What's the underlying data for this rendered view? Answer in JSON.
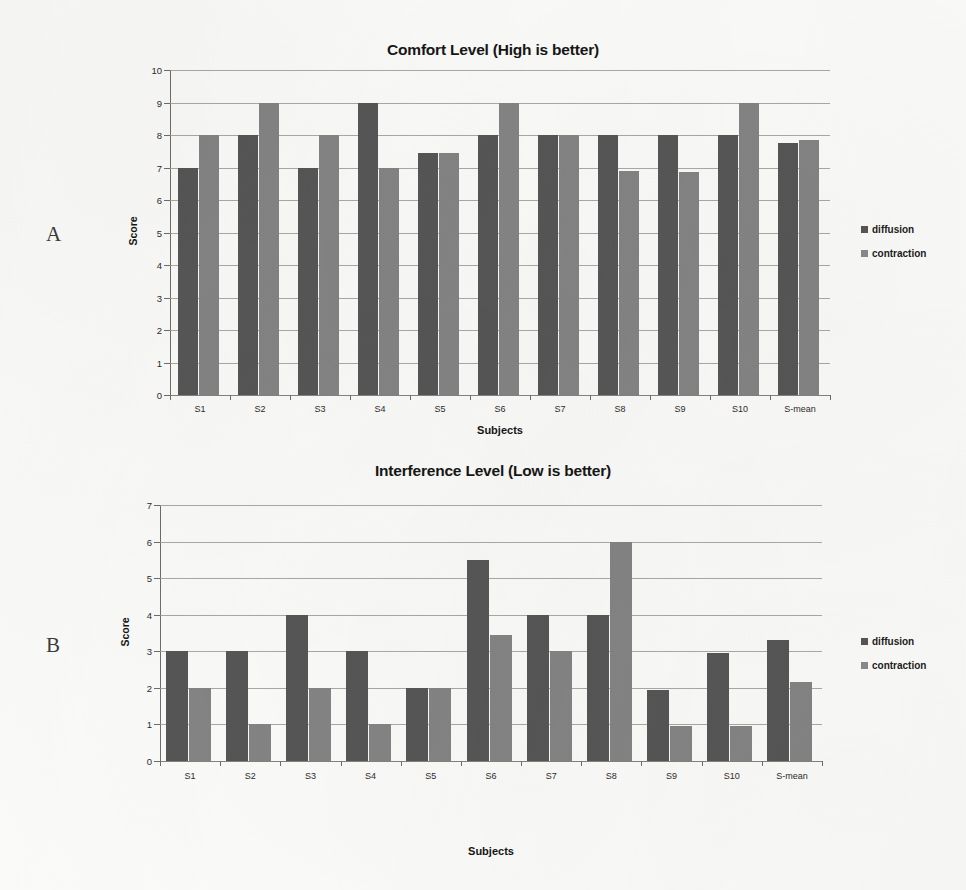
{
  "figure": {
    "panels": [
      {
        "letter": "A"
      },
      {
        "letter": "B"
      }
    ]
  },
  "legend": {
    "diffusion_label": "diffusion",
    "contraction_label": "contraction",
    "diffusion_color": "#565656",
    "contraction_color": "#8a8a8a",
    "position": "right"
  },
  "chart_data": [
    {
      "type": "bar",
      "panel": "A",
      "title": "Comfort Level (High is better)",
      "xlabel": "Subjects",
      "ylabel": "Score",
      "ylim": [
        0,
        10
      ],
      "yticks": [
        0,
        1,
        2,
        3,
        4,
        5,
        6,
        7,
        8,
        9,
        10
      ],
      "grid": true,
      "categories": [
        "S1",
        "S2",
        "S3",
        "S4",
        "S5",
        "S6",
        "S7",
        "S8",
        "S9",
        "S10",
        "S-mean"
      ],
      "series": [
        {
          "name": "diffusion",
          "color": "#565656",
          "values": [
            7,
            8,
            7,
            9,
            7.45,
            8,
            8,
            8,
            8,
            8,
            7.75
          ]
        },
        {
          "name": "contraction",
          "color": "#848484",
          "values": [
            8,
            9,
            8,
            7,
            7.45,
            9,
            8,
            6.9,
            6.85,
            9,
            7.85
          ]
        }
      ]
    },
    {
      "type": "bar",
      "panel": "B",
      "title": "Interference Level (Low is better)",
      "xlabel": "Subjects",
      "ylabel": "Score",
      "ylim": [
        0,
        7
      ],
      "yticks": [
        0,
        1,
        2,
        3,
        4,
        5,
        6,
        7
      ],
      "grid": true,
      "categories": [
        "S1",
        "S2",
        "S3",
        "S4",
        "S5",
        "S6",
        "S7",
        "S8",
        "S9",
        "S10",
        "S-mean"
      ],
      "series": [
        {
          "name": "diffusion",
          "color": "#565656",
          "values": [
            3,
            3,
            4,
            3,
            2,
            5.5,
            4,
            4,
            1.95,
            2.95,
            3.3
          ]
        },
        {
          "name": "contraction",
          "color": "#848484",
          "values": [
            2,
            1,
            2,
            1,
            2,
            3.45,
            3,
            6,
            0.95,
            0.95,
            2.15
          ]
        }
      ]
    }
  ]
}
